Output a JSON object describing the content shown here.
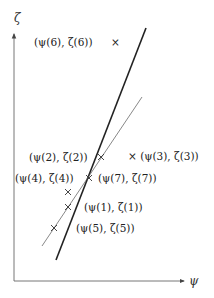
{
  "diagram": {
    "type": "scatter-with-fitted-lines",
    "axes": {
      "x_label": "ψ",
      "y_label": "ζ",
      "color": "#555555"
    },
    "lines": [
      {
        "name": "thick-line",
        "x1": 146,
        "y1": 28,
        "x2": 56,
        "y2": 260,
        "width": 1.6,
        "color": "#222222"
      },
      {
        "name": "thin-line",
        "x1": 142,
        "y1": 97,
        "x2": 42,
        "y2": 246,
        "width": 0.7,
        "color": "#555555"
      }
    ],
    "points": [
      {
        "id": 6,
        "label": "(ψ(6), ζ(6))",
        "mx": 117,
        "my": 43,
        "lx": 34,
        "ly": 46
      },
      {
        "id": 3,
        "label": "× (ψ(3), ζ(3))",
        "mx": null,
        "my": null,
        "lx": 128,
        "ly": 160
      },
      {
        "id": 2,
        "label": "(ψ(2), ζ(2))",
        "mx": 101,
        "my": 157,
        "lx": 29,
        "ly": 161
      },
      {
        "id": 4,
        "label": "(ψ(4), ζ(4))",
        "mx": 68,
        "my": 192,
        "lx": 15,
        "ly": 182
      },
      {
        "id": 7,
        "label": "(ψ(7), ζ(7))",
        "mx": 89,
        "my": 178,
        "lx": 98,
        "ly": 182
      },
      {
        "id": 1,
        "label": "(ψ(1), ζ(1))",
        "mx": 68,
        "my": 207,
        "lx": 84,
        "ly": 211
      },
      {
        "id": 5,
        "label": "(ψ(5), ζ(5))",
        "mx": 54,
        "my": 228,
        "lx": 76,
        "ly": 232
      }
    ]
  }
}
